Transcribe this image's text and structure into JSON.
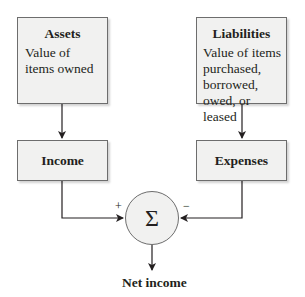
{
  "assets": {
    "title": "Assets",
    "description": "Value of\nitems owned"
  },
  "liabilities": {
    "title": "Liabilities",
    "description": "Value of items\npurchased,\nborrowed,\nowed, or leased"
  },
  "income": {
    "title": "Income"
  },
  "expenses": {
    "title": "Expenses"
  },
  "sum_node": {
    "symbol": "Σ",
    "plus_sign": "+",
    "minus_sign": "−"
  },
  "output": {
    "label": "Net income"
  }
}
